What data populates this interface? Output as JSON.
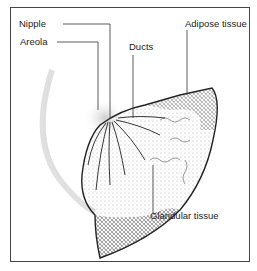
{
  "diagram": {
    "labels": {
      "nipple": "Nipple",
      "areola": "Areola",
      "ducts": "Ducts",
      "adipose": "Adipose tissue",
      "glandular": "Glandular tissue"
    }
  }
}
